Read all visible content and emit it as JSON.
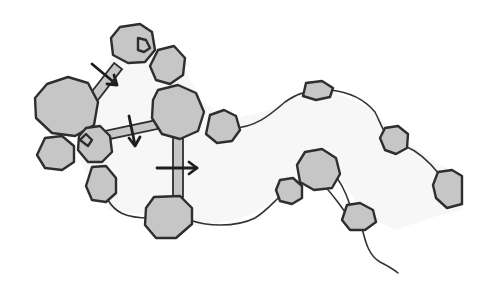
{
  "diagram": {
    "title": "",
    "colors": {
      "background": "#ffffff",
      "channel_fill": "#f7f7f7",
      "node_fill": "#c6c6c6",
      "outline": "#2e2e2e",
      "arrow": "#1e1e1e"
    },
    "arrows": [
      {
        "name": "arrow-down-right",
        "direction": "down-right"
      },
      {
        "name": "arrow-down",
        "direction": "down"
      },
      {
        "name": "arrow-right",
        "direction": "right"
      }
    ],
    "node_count": 17,
    "bridge_count": 3
  }
}
